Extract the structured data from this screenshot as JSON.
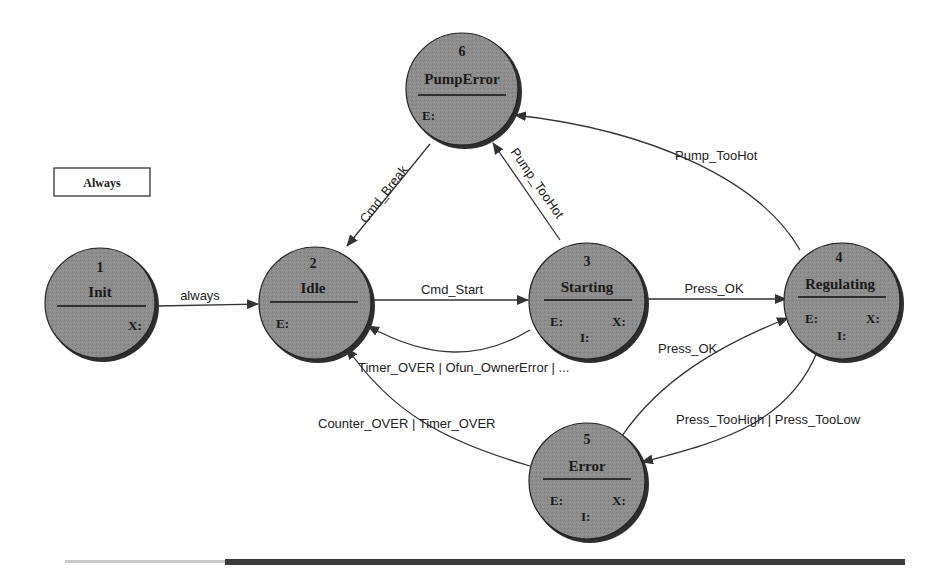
{
  "diagram": {
    "type": "state-machine",
    "legend": {
      "label": "Always"
    },
    "colors": {
      "state_fill": "#8c8c8c",
      "state_shadow": "#2e2e2e",
      "edge": "#333333",
      "text": "#1a1a1a",
      "footer_bar": "#3a3a3a"
    },
    "states": [
      {
        "id": "1",
        "name": "Init",
        "slots": {
          "x": "X:"
        }
      },
      {
        "id": "2",
        "name": "Idle",
        "slots": {
          "e": "E:"
        }
      },
      {
        "id": "3",
        "name": "Starting",
        "slots": {
          "e": "E:",
          "x": "X:",
          "i": "I:"
        }
      },
      {
        "id": "4",
        "name": "Regulating",
        "slots": {
          "e": "E:",
          "x": "X:",
          "i": "I:"
        }
      },
      {
        "id": "5",
        "name": "Error",
        "slots": {
          "e": "E:",
          "x": "X:",
          "i": "I:"
        }
      },
      {
        "id": "6",
        "name": "PumpError",
        "slots": {
          "e": "E:"
        }
      }
    ],
    "transitions": [
      {
        "from": "1",
        "to": "2",
        "label": "always"
      },
      {
        "from": "2",
        "to": "3",
        "label": "Cmd_Start"
      },
      {
        "from": "3",
        "to": "2",
        "label": "Timer_OVER | Ofun_OwnerError | ..."
      },
      {
        "from": "3",
        "to": "4",
        "label": "Press_OK"
      },
      {
        "from": "3",
        "to": "6",
        "label": "Pump_TooHot"
      },
      {
        "from": "6",
        "to": "2",
        "label": "Cmd_Break"
      },
      {
        "from": "4",
        "to": "6",
        "label": "Pump_TooHot"
      },
      {
        "from": "4",
        "to": "5",
        "label": "Press_TooHigh | Press_TooLow"
      },
      {
        "from": "5",
        "to": "4",
        "label": "Press_OK"
      },
      {
        "from": "5",
        "to": "2",
        "label": "Counter_OVER | Timer_OVER"
      }
    ]
  }
}
